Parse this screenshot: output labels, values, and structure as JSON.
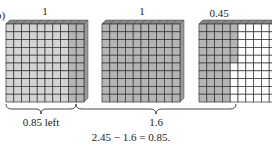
{
  "figure": {
    "marker": "b)",
    "blocks": [
      {
        "label": "1",
        "value": 1.0,
        "shaded": 1.0,
        "split_at": 0.85,
        "color_left": "#d4d4d4",
        "color_right": "#b5b5b5"
      },
      {
        "label": "1",
        "value": 1.0,
        "shaded": 1.0,
        "color": "#b5b5b5"
      },
      {
        "label": "0.45",
        "value": 0.45,
        "shaded": 0.45,
        "color": "#b5b5b5",
        "empty_color": "#ffffff"
      }
    ],
    "braces": [
      {
        "label": "0.85 left"
      },
      {
        "label": "1.6"
      }
    ],
    "equation": "2.45 − 1.6 = 0.85.",
    "grid": {
      "rows": 10,
      "cols": 10
    },
    "colors": {
      "grid_line": "#333333",
      "depth_top": "#888888",
      "depth_side": "#9a9a9a"
    }
  }
}
